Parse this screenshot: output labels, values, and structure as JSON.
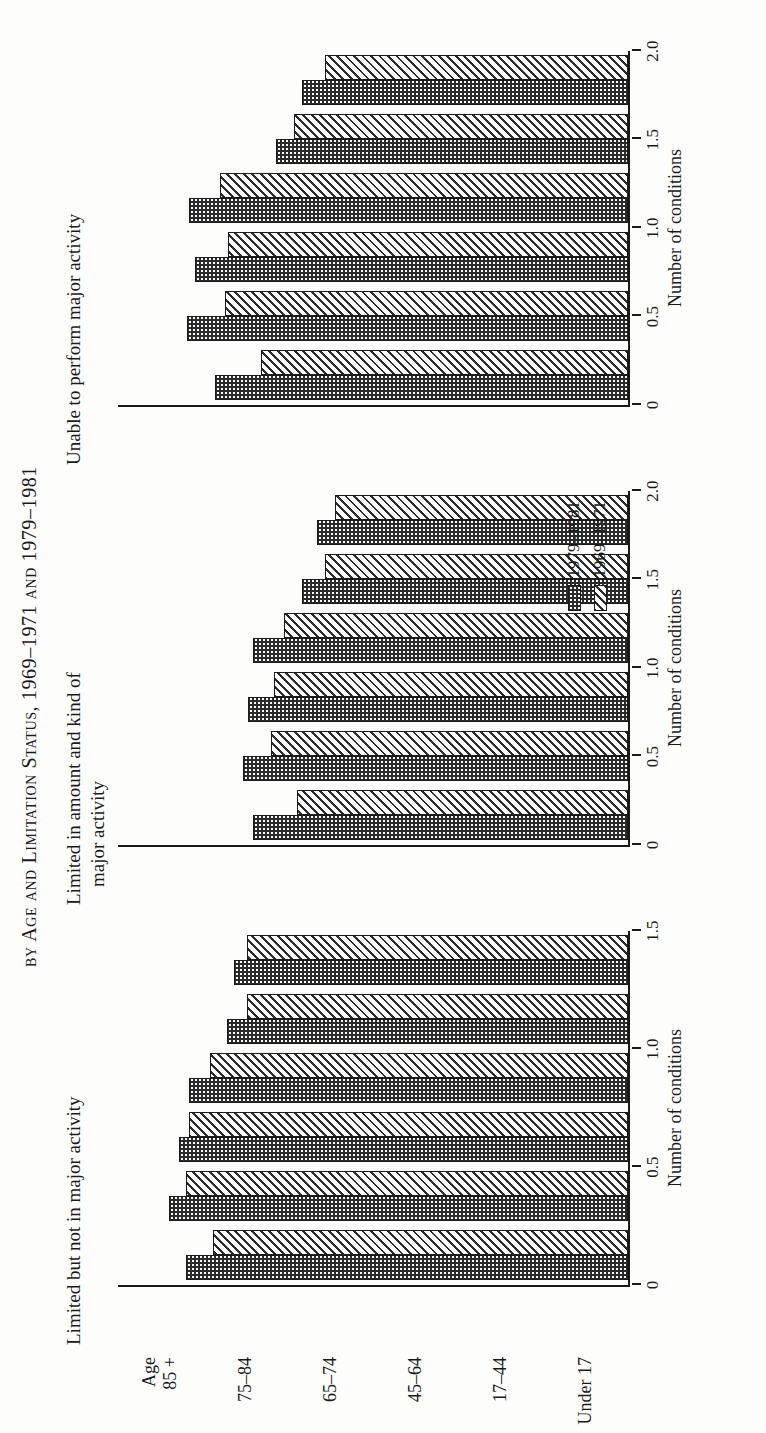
{
  "figure": {
    "title": "by Age and Limitation Status, 1969–1971 and 1979–1981",
    "axis_title": "Number of conditions"
  },
  "panels": [
    {
      "title_line1": "Limited but not in major activity",
      "title_line2": "",
      "axis_title": "Number of conditions",
      "ticks": [
        "0",
        "0.5",
        "1.0",
        "1.5"
      ]
    },
    {
      "title_line1": "Limited in amount and kind of",
      "title_line2": "major activity",
      "axis_title": "Number of conditions",
      "ticks": [
        "0",
        "0.5",
        "1.0",
        "1.5",
        "2.0"
      ]
    },
    {
      "title_line1": "Unable to perform major activity",
      "title_line2": "",
      "axis_title": "Number of conditions",
      "ticks": [
        "0",
        "0.5",
        "1.0",
        "1.5",
        "2.0"
      ]
    }
  ],
  "legend": {
    "items": [
      {
        "label": "1979–1981",
        "pattern": "crosshatch"
      },
      {
        "label": "1969–1971",
        "pattern": "diagonal-hatch"
      }
    ]
  },
  "categories": [
    {
      "line1": "Age",
      "line2": "85 +"
    },
    {
      "line1": "75–84",
      "line2": ""
    },
    {
      "line1": "65–74",
      "line2": ""
    },
    {
      "line1": "45–64",
      "line2": ""
    },
    {
      "line1": "17–44",
      "line2": ""
    },
    {
      "line1": "Under 17",
      "line2": ""
    }
  ],
  "chart_data": {
    "type": "bar",
    "title": "by Age and Limitation Status, 1969–1971 and 1979–1981",
    "xlabel": "Number of conditions",
    "ylabel": "",
    "orientation": "horizontal-grouped-panels",
    "categories": [
      "Age 85 +",
      "75–84",
      "65–74",
      "45–64",
      "17–44",
      "Under 17"
    ],
    "panels": [
      {
        "name": "Limited but not in major activity",
        "xlim": [
          0,
          1.5
        ],
        "xticks": [
          0,
          0.5,
          1.0,
          1.5
        ],
        "series": [
          {
            "name": "1979–1981",
            "values": [
              1.3,
              1.35,
              1.32,
              1.29,
              1.18,
              1.16
            ]
          },
          {
            "name": "1969–1971",
            "values": [
              1.22,
              1.3,
              1.29,
              1.23,
              1.12,
              1.12
            ]
          }
        ]
      },
      {
        "name": "Limited in amount and kind of major activity",
        "xlim": [
          0,
          2.0
        ],
        "xticks": [
          0,
          0.5,
          1.0,
          1.5,
          2.0
        ],
        "series": [
          {
            "name": "1979–1981",
            "values": [
              1.47,
              1.51,
              1.49,
              1.47,
              1.28,
              1.22
            ]
          },
          {
            "name": "1969–1971",
            "values": [
              1.3,
              1.4,
              1.39,
              1.35,
              1.19,
              1.15
            ]
          }
        ]
      },
      {
        "name": "Unable to perform major activity",
        "xlim": [
          0,
          2.0
        ],
        "xticks": [
          0,
          0.5,
          1.0,
          1.5,
          2.0
        ],
        "series": [
          {
            "name": "1979–1981",
            "values": [
              1.62,
              1.73,
              1.7,
              1.72,
              1.38,
              1.28
            ]
          },
          {
            "name": "1969–1971",
            "values": [
              1.44,
              1.58,
              1.57,
              1.6,
              1.31,
              1.19
            ]
          }
        ]
      }
    ],
    "legend": [
      "1979–1981",
      "1969–1971"
    ],
    "legend_position": "middle-panel-lower-right",
    "grid": false
  }
}
